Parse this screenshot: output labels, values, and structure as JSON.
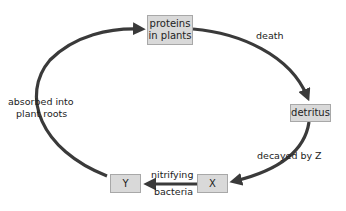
{
  "diagram": {
    "nodes": [
      {
        "id": "proteins",
        "label_line1": "proteins",
        "label_line2": "in plants"
      },
      {
        "id": "detritus",
        "label": "detritus"
      },
      {
        "id": "x",
        "label": "X"
      },
      {
        "id": "y",
        "label": "Y"
      }
    ],
    "edges": [
      {
        "from": "proteins",
        "to": "detritus",
        "label": "death"
      },
      {
        "from": "detritus",
        "to": "x",
        "label": "decayed by Z"
      },
      {
        "from": "x",
        "to": "y",
        "label_line1": "nitrifying",
        "label_line2": "bacteria"
      },
      {
        "from": "y",
        "to": "proteins",
        "label_line1": "absorbed into",
        "label_line2": "plant roots"
      }
    ],
    "colors": {
      "box_fill": "#d9d9d9",
      "box_border": "#a8a8a8",
      "arrow": "#3a3a3a"
    }
  }
}
